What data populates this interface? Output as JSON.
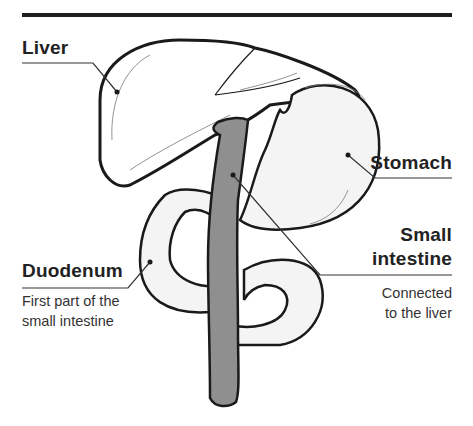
{
  "diagram": {
    "colors": {
      "rule": "#1e1e1e",
      "outline": "#1a1a1a",
      "organ_fill": "#f4f4f4",
      "duct_fill": "#8f8f8f",
      "leader": "#333333"
    },
    "labels": {
      "liver": {
        "title": "Liver"
      },
      "stomach": {
        "title": "Stomach"
      },
      "small_intestine": {
        "title_line1": "Small",
        "title_line2": "intestine",
        "desc_line1": "Connected",
        "desc_line2": "to the liver"
      },
      "duodenum": {
        "title": "Duodenum",
        "desc_line1": "First part of the",
        "desc_line2": "small intestine"
      }
    }
  }
}
